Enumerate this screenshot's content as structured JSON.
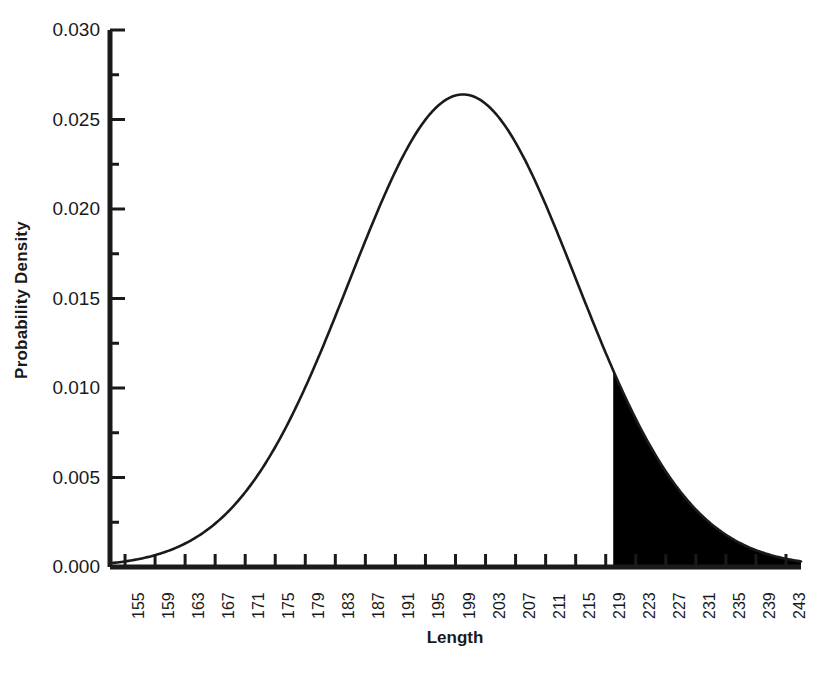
{
  "chart_data": {
    "type": "line",
    "title": "",
    "subtitle": "",
    "xlabel": "Length",
    "ylabel": "Probability Density",
    "xlim": [
      153,
      245
    ],
    "ylim": [
      0.0,
      0.03
    ],
    "grid": false,
    "legend": null,
    "x_ticks": [
      155,
      159,
      163,
      167,
      171,
      175,
      179,
      183,
      187,
      191,
      195,
      199,
      203,
      207,
      211,
      215,
      219,
      223,
      227,
      231,
      235,
      239,
      243
    ],
    "x_tick_labels": [
      "155",
      "159",
      "163",
      "167",
      "171",
      "175",
      "179",
      "183",
      "187",
      "191",
      "195",
      "199",
      "203",
      "207",
      "211",
      "215",
      "219",
      "223",
      "227",
      "231",
      "235",
      "239",
      "243"
    ],
    "y_ticks": [
      0.0,
      0.005,
      0.01,
      0.015,
      0.02,
      0.025,
      0.03
    ],
    "y_tick_labels": [
      "0.000",
      "0.005",
      "0.010",
      "0.015",
      "0.020",
      "0.025",
      "0.030"
    ],
    "y_minor_ticks": [
      0.0025,
      0.0075,
      0.0125,
      0.0175,
      0.0225,
      0.0275
    ],
    "distribution": {
      "kind": "normal",
      "mean": 200,
      "std_dev": 15.1,
      "peak_density": 0.0264
    },
    "shaded_region": {
      "label": "upper tail",
      "from_x": 220,
      "to_x": 245,
      "fill_color": "#000000",
      "density_at_from_x": 0.0105
    },
    "series": [
      {
        "name": "Probability Density",
        "color": "#1a1a1a",
        "x": [
          155,
          159,
          163,
          167,
          171,
          175,
          179,
          183,
          187,
          191,
          195,
          199,
          203,
          207,
          211,
          215,
          219,
          223,
          227,
          231,
          235,
          239,
          243,
          245
        ],
        "values": [
          0.00026,
          0.00077,
          0.0019,
          0.0041,
          0.00762,
          0.01253,
          0.01825,
          0.02362,
          0.02627,
          0.02614,
          0.02378,
          0.02032,
          0.01571,
          0.0108,
          0.00666,
          0.00366,
          0.00179,
          0.00078,
          0.0003,
          0.0001,
          3e-05,
          1e-05,
          3e-06,
          1e-06
        ]
      }
    ]
  },
  "axes": {
    "y_axis_title": "Probability Density",
    "x_axis_title": "Length"
  },
  "caption": {
    "partial_text": ""
  },
  "colors": {
    "axis": "#1a1a1a",
    "curve": "#1a1a1a",
    "shade": "#000000",
    "background": "#ffffff"
  }
}
